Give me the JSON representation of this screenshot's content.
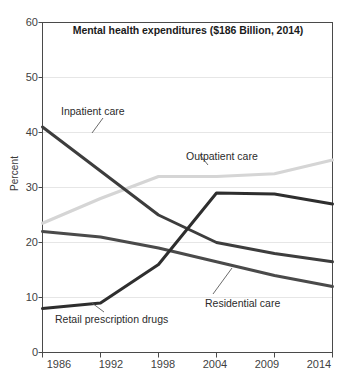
{
  "chart_data": {
    "type": "line",
    "title": "Mental health expenditures ($186 Billion, 2014)",
    "xlabel": "",
    "ylabel": "Percent",
    "categories": [
      "1986",
      "1992",
      "1998",
      "2004",
      "2009",
      "2014"
    ],
    "x": [
      1986,
      1992,
      1998,
      2004,
      2009,
      2014
    ],
    "ylim": [
      0,
      60
    ],
    "yticks": [
      0,
      10,
      20,
      30,
      40,
      50,
      60
    ],
    "grid": true,
    "legend_position": "inline-annotations",
    "series": [
      {
        "name": "Inpatient care",
        "color": "#3d3d3d",
        "values": [
          41,
          33,
          25,
          20,
          18,
          16.5
        ]
      },
      {
        "name": "Outpatient care",
        "color": "#d5d5d5",
        "values": [
          23.5,
          28,
          32,
          32,
          32.5,
          35
        ]
      },
      {
        "name": "Residential care",
        "color": "#4a4a4a",
        "values": [
          22,
          21,
          19,
          16.5,
          14,
          12
        ]
      },
      {
        "name": "Retail prescription drugs",
        "color": "#2e2e2e",
        "values": [
          8,
          9,
          16,
          29,
          28.8,
          27
        ]
      }
    ],
    "annotations": [
      {
        "text": "Inpatient care",
        "series": "Inpatient care"
      },
      {
        "text": "Outpatient care",
        "series": "Outpatient care"
      },
      {
        "text": "Residential care",
        "series": "Residential care"
      },
      {
        "text": "Retail prescription drugs",
        "series": "Retail prescription drugs"
      }
    ]
  },
  "axis": {
    "y_tick_labels": [
      "60",
      "50",
      "40",
      "30",
      "20",
      "10",
      "0"
    ],
    "x_tick_labels": [
      "1986",
      "1992",
      "1998",
      "2004",
      "2009",
      "2014"
    ],
    "y_title": "Percent"
  }
}
